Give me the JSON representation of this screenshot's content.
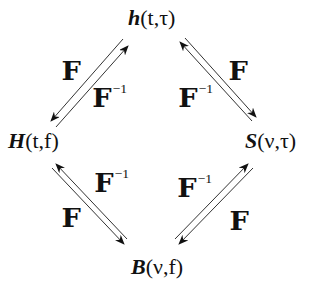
{
  "nodes": {
    "top": {
      "symbol": "h",
      "args": "(t,τ)"
    },
    "left": {
      "symbol": "H",
      "args": "(t,f)"
    },
    "right": {
      "symbol": "S",
      "args": "(ν,τ)"
    },
    "bottom": {
      "symbol": "B",
      "args": "(ν,f)"
    }
  },
  "operators": {
    "forward": "F",
    "inverse": "F",
    "inverse_exponent": "−1"
  },
  "edges": [
    {
      "from": "left",
      "to": "top",
      "forward_label": "F",
      "inverse_label": "F⁻¹"
    },
    {
      "from": "right",
      "to": "top",
      "forward_label": "F",
      "inverse_label": "F⁻¹"
    },
    {
      "from": "left",
      "to": "bottom",
      "forward_label": "F",
      "inverse_label": "F⁻¹"
    },
    {
      "from": "right",
      "to": "bottom",
      "forward_label": "F",
      "inverse_label": "F⁻¹"
    }
  ],
  "colors": {
    "ink": "#111111",
    "background": "#ffffff"
  }
}
